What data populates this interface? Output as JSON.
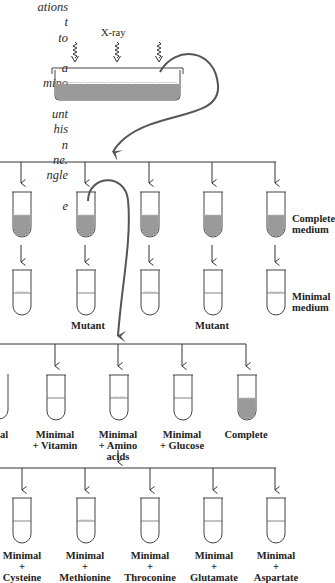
{
  "side_text": {
    "lines": [
      "ations",
      "t",
      "to",
      "",
      "a",
      "mino",
      "",
      "unt",
      "his",
      "n",
      "ne.",
      "ngle",
      "",
      "e"
    ]
  },
  "xray": {
    "label": "X-ray"
  },
  "row1": {
    "right_labels": {
      "top": [
        "Complete",
        "medium"
      ],
      "bottom": [
        "Minimal",
        "medium"
      ]
    },
    "mutant_labels": [
      "Mutant",
      "Mutant"
    ]
  },
  "row2": {
    "labels": [
      [
        "al"
      ],
      [
        "Minimal",
        "+ Vitamin"
      ],
      [
        "Minimal",
        "+ Amino",
        "acids"
      ],
      [
        "Minimal",
        "+ Glucose"
      ],
      [
        "Complete"
      ]
    ]
  },
  "row3": {
    "labels": [
      [
        "Minimal",
        "+",
        "Cysteine"
      ],
      [
        "Minimal",
        "+",
        "Methionine"
      ],
      [
        "Minimal",
        "+",
        "Throconine"
      ],
      [
        "Minimal",
        "+",
        "Glutamate"
      ],
      [
        "Minimal",
        "+",
        "Aspartate"
      ]
    ]
  },
  "colors": {
    "medium_fill": "#9a9a9a",
    "line": "#333333",
    "curve": "#555555"
  }
}
